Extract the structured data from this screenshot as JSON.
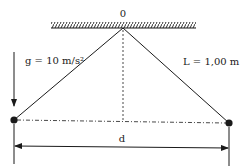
{
  "diagram": {
    "type": "double-pendulum-setup",
    "pivot_label": "0",
    "gravity_label": "g = 10 m/s²",
    "length_label": "L = 1,00 m",
    "distance_label": "d",
    "colors": {
      "ink": "#1a1a1a",
      "background": "#ffffff"
    }
  }
}
